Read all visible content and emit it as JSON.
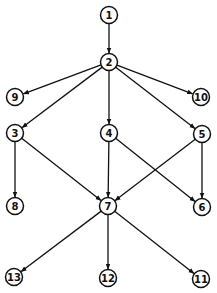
{
  "diagram": {
    "type": "directed-graph",
    "nodes": [
      {
        "id": "1",
        "label": "1"
      },
      {
        "id": "2",
        "label": "2"
      },
      {
        "id": "3",
        "label": "3"
      },
      {
        "id": "4",
        "label": "4"
      },
      {
        "id": "5",
        "label": "5"
      },
      {
        "id": "6",
        "label": "6"
      },
      {
        "id": "7",
        "label": "7"
      },
      {
        "id": "8",
        "label": "8"
      },
      {
        "id": "9",
        "label": "9"
      },
      {
        "id": "10",
        "label": "10"
      },
      {
        "id": "11",
        "label": "11"
      },
      {
        "id": "12",
        "label": "12"
      },
      {
        "id": "13",
        "label": "13"
      }
    ],
    "edges": [
      {
        "from": "1",
        "to": "2"
      },
      {
        "from": "2",
        "to": "9"
      },
      {
        "from": "2",
        "to": "3"
      },
      {
        "from": "2",
        "to": "4"
      },
      {
        "from": "2",
        "to": "5"
      },
      {
        "from": "2",
        "to": "10"
      },
      {
        "from": "3",
        "to": "8"
      },
      {
        "from": "3",
        "to": "7"
      },
      {
        "from": "4",
        "to": "7"
      },
      {
        "from": "4",
        "to": "6"
      },
      {
        "from": "5",
        "to": "7"
      },
      {
        "from": "5",
        "to": "6"
      },
      {
        "from": "7",
        "to": "13"
      },
      {
        "from": "7",
        "to": "12"
      },
      {
        "from": "7",
        "to": "11"
      }
    ],
    "colors": {
      "stroke": "#111111",
      "background": "#ffffff"
    }
  }
}
